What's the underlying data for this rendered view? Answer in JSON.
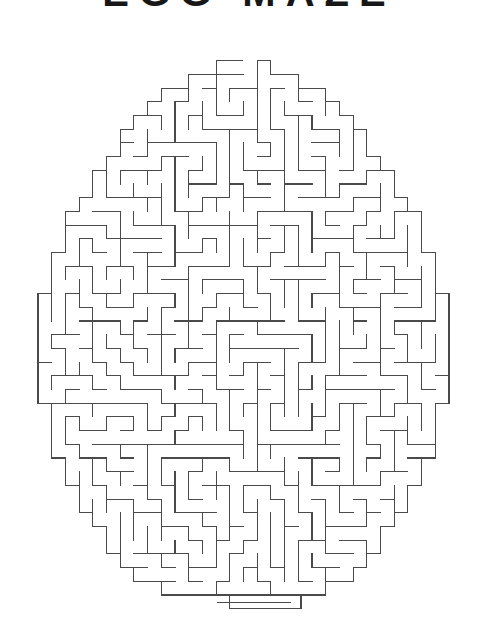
{
  "page": {
    "kind": "printed-puzzle-page",
    "background_color": "#ffffff",
    "width": 498,
    "height": 640
  },
  "title_crop": {
    "text": "EGG MAZE",
    "note_visible": "only the bottom edges of the letters are visible at the top of the crop",
    "color": "#171717"
  },
  "maze": {
    "name": "egg-shaped-maze",
    "shape": "egg",
    "line_color": "#4a4a4a",
    "line_width": 1,
    "cell_size": 13.7,
    "columns": 30,
    "rows": 40,
    "origin_x": 38,
    "origin_y": 47,
    "entrance": "top-center",
    "exit": "bottom-center-tail",
    "exit_tail_rows": 3,
    "mask": {
      "type": "egg",
      "center_x": 0.5,
      "center_y": 0.53,
      "radius_x": 0.5,
      "radius_y": 0.5,
      "taper_top": 0.78
    },
    "seed": 20240917
  },
  "chart_data": {
    "type": "table",
    "title": "Egg Maze",
    "categories": [
      "columns",
      "rows",
      "cell_size_px"
    ],
    "values": [
      30,
      40,
      13.7
    ]
  }
}
